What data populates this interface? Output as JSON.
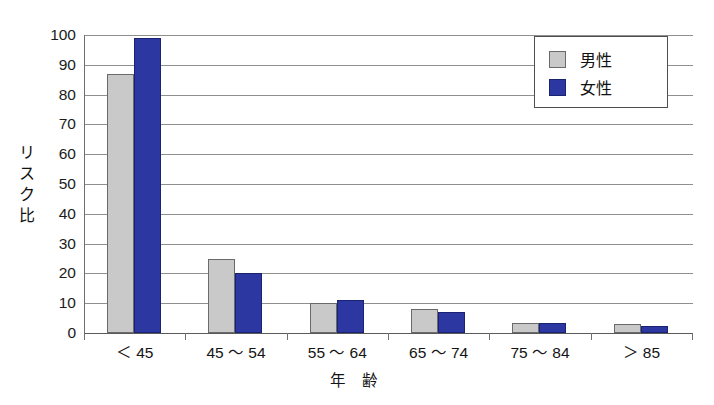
{
  "chart_data": {
    "type": "bar",
    "title": "",
    "xlabel": "年 齢",
    "ylabel": "リスク比",
    "ylim": [
      0,
      100
    ],
    "ytick_step": 10,
    "yticks": [
      "100",
      "90",
      "80",
      "70",
      "60",
      "50",
      "40",
      "30",
      "20",
      "10",
      "0"
    ],
    "grid": true,
    "legend_position": "top-right",
    "categories": [
      "＜ 45",
      "45 〜 54",
      "55 〜 64",
      "65 〜 74",
      "75 〜 84",
      "＞ 85"
    ],
    "series": [
      {
        "name": "男性",
        "color": "#c9c9c9",
        "values": [
          87,
          25,
          10,
          8,
          3.5,
          3
        ]
      },
      {
        "name": "女性",
        "color": "#2d37a2",
        "values": [
          99,
          20,
          11,
          7,
          3.5,
          2.5
        ]
      }
    ]
  },
  "legend": {
    "items": [
      {
        "label": "男性",
        "swatch": "male-swatch"
      },
      {
        "label": "女性",
        "swatch": "female-swatch"
      }
    ]
  },
  "y_axis_title_chars": [
    "リ",
    "ス",
    "ク",
    "比"
  ]
}
